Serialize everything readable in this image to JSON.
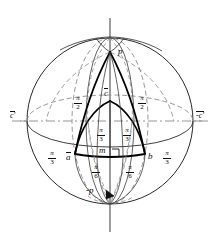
{
  "figure": {
    "type": "geometric-diagram"
  },
  "points": {
    "north_pole": "p",
    "south_pole": "-p",
    "apex_inner": "c",
    "foot": "m",
    "left_vertex": "a",
    "right_vertex": "b",
    "left_axis_end": "c'",
    "right_axis_end": "-c'"
  },
  "arc_labels": [
    {
      "id": "upper-left",
      "num": "π",
      "den": "2"
    },
    {
      "id": "upper-right",
      "num": "π",
      "den": "2"
    },
    {
      "id": "mid-left",
      "num": "π",
      "den": "3"
    },
    {
      "id": "mid-right",
      "num": "π",
      "den": "3"
    },
    {
      "id": "outer-left",
      "num": "π",
      "den": "3"
    },
    {
      "id": "outer-right",
      "num": "π",
      "den": "3"
    },
    {
      "id": "lower-left",
      "num": "π",
      "den": "6"
    },
    {
      "id": "lower-right",
      "num": "π",
      "den": "6"
    }
  ],
  "markers": {
    "right_angle_at_m": true
  },
  "colors": {
    "ink": "#1a1a1a",
    "heavy_ink": "#000000",
    "hidden_line": "#777777",
    "background": "#ffffff"
  }
}
